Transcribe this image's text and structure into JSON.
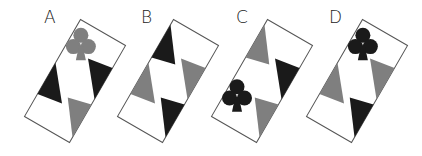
{
  "options": [
    {
      "label": "A",
      "label_x": 44,
      "label_y": 9,
      "cx": 75,
      "cy": 81,
      "club": {
        "corner": "top",
        "color": "gray"
      },
      "pieces": {
        "top": "club-gray",
        "right": "black",
        "left": "black",
        "bottom": "gray"
      }
    },
    {
      "label": "B",
      "label_x": 141,
      "label_y": 9,
      "cx": 168,
      "cy": 81,
      "club": null,
      "pieces": {
        "top": "black",
        "right": "gray",
        "left": "gray",
        "bottom": "black"
      }
    },
    {
      "label": "C",
      "label_x": 236,
      "label_y": 9,
      "cx": 262,
      "cy": 81,
      "club": {
        "corner": "left",
        "color": "black"
      },
      "pieces": {
        "top": "gray",
        "right": "black",
        "left": "club-black",
        "bottom": "gray"
      }
    },
    {
      "label": "D",
      "label_x": 328,
      "label_y": 9,
      "cx": 357,
      "cy": 81,
      "club": {
        "corner": "top",
        "color": "black"
      },
      "pieces": {
        "top": "club-black",
        "right": "gray",
        "left": "gray",
        "bottom": "black"
      }
    }
  ],
  "colors": {
    "black": "#1a1a1a",
    "gray": "#7f7f7f",
    "border": "#555555",
    "background": "#ffffff"
  }
}
